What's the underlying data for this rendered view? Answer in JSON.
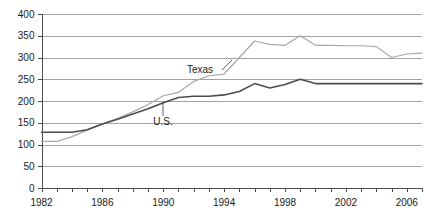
{
  "chart_data": {
    "type": "line",
    "title": "",
    "xlabel": "",
    "ylabel": "",
    "xlim": [
      1982,
      2007
    ],
    "ylim": [
      0,
      400
    ],
    "ytick_step": 50,
    "grid": true,
    "legend_position": "inline-annotations",
    "x_tick_labels": [
      "1982",
      "1986",
      "1990",
      "1994",
      "1998",
      "2002",
      "2006"
    ],
    "x_tick_values": [
      1982,
      1986,
      1990,
      1994,
      1998,
      2002,
      2006
    ],
    "x_minor_tick_values": [
      1982,
      1983,
      1984,
      1985,
      1986,
      1987,
      1988,
      1989,
      1990,
      1991,
      1992,
      1993,
      1994,
      1995,
      1996,
      1997,
      1998,
      1999,
      2000,
      2001,
      2002,
      2003,
      2004,
      2005,
      2006,
      2007
    ],
    "y_tick_labels": [
      "0",
      "50",
      "100",
      "150",
      "200",
      "250",
      "300",
      "350",
      "400"
    ],
    "y_tick_values": [
      0,
      50,
      100,
      150,
      200,
      250,
      300,
      350,
      400
    ],
    "x": [
      1982,
      1983,
      1984,
      1985,
      1986,
      1987,
      1988,
      1989,
      1990,
      1991,
      1992,
      1993,
      1994,
      1995,
      1996,
      1997,
      1998,
      1999,
      2000,
      2001,
      2002,
      2003,
      2004,
      2005,
      2006,
      2007
    ],
    "series": [
      {
        "name": "Texas",
        "color": "#a8a8a8",
        "label_text": "Texas",
        "values": [
          107,
          107,
          118,
          133,
          147,
          160,
          175,
          192,
          212,
          220,
          245,
          258,
          262,
          300,
          338,
          330,
          328,
          350,
          328,
          328,
          327,
          327,
          325,
          300,
          308,
          310
        ]
      },
      {
        "name": "U.S.",
        "color": "#4d4d4d",
        "label_text": "U.S.",
        "values": [
          128,
          128,
          128,
          134,
          147,
          158,
          170,
          182,
          196,
          208,
          211,
          211,
          214,
          222,
          240,
          230,
          238,
          250,
          240,
          240,
          240,
          240,
          240,
          240,
          240,
          240
        ]
      }
    ],
    "annotations": [
      {
        "text": "Texas",
        "data_name": "texas-series-label",
        "x_px": 200,
        "y_px": 73,
        "leader_from_x_px": 222,
        "leader_from_y_px": 70,
        "leader_to_x_px": 232,
        "leader_to_y_px": 60
      },
      {
        "text": "U.S.",
        "data_name": "us-series-label",
        "x_px": 163,
        "y_px": 125,
        "leader_from_x_px": 163,
        "leader_from_y_px": 116,
        "leader_to_x_px": 163,
        "leader_to_y_px": 102
      }
    ],
    "colors": {
      "texas_line": "#a8a8a8",
      "us_line": "#4d4d4d",
      "gridline": "#8c8c8c",
      "axis": "#4d4d4d",
      "text": "#1a1a1a",
      "background": "#ffffff"
    }
  }
}
